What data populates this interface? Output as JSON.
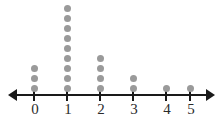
{
  "chart_data": {
    "type": "dotplot",
    "title": "",
    "subtitle": "",
    "xlabel": "",
    "ylabel": "",
    "categories": [
      "0",
      "1",
      "2",
      "3",
      "4",
      "5"
    ],
    "values": [
      3,
      9,
      4,
      2,
      1,
      1
    ],
    "tick_labels": [
      "0",
      "1",
      "2",
      "3",
      "4",
      "5"
    ],
    "xlim": [
      0,
      5
    ],
    "grid": false,
    "legend": null,
    "axis": {
      "orientation": "horizontal",
      "arrow_left": true,
      "arrow_right": true,
      "line_color": "#1a1a1a",
      "label_color": "#2b2b2b"
    },
    "marker": {
      "shape": "circle",
      "color": "#9a9a9a",
      "diameter_px": 7,
      "vertical_spacing_px": 10
    },
    "annotations": []
  },
  "geometry": {
    "tick_x": [
      34,
      67,
      100,
      133,
      166,
      190
    ],
    "baseline_y": 85,
    "axis_y": 94
  }
}
